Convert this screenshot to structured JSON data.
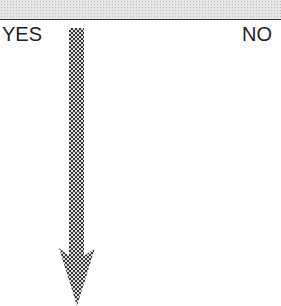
{
  "diagram": {
    "banner": {
      "pattern": "dotted-gray",
      "color": "#e6e6e6",
      "border_color": "#333333"
    },
    "labels": {
      "yes": "YES",
      "no": "NO"
    },
    "arrow": {
      "direction": "down",
      "pattern": "checkered",
      "color": "#444444",
      "from_label": "YES"
    }
  }
}
